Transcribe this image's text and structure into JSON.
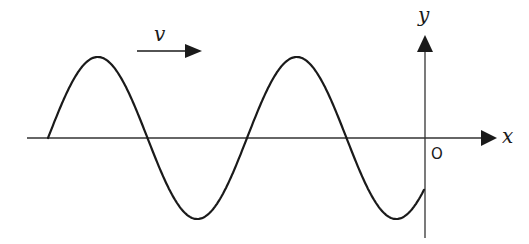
{
  "diagram": {
    "labels": {
      "velocity": "v",
      "x_axis": "x",
      "y_axis": "y",
      "origin": "O"
    },
    "colors": {
      "stroke": "#1a1a1a",
      "axis": "#333333",
      "background": "#ffffff"
    },
    "wave": {
      "type": "sinusoid",
      "direction": "+x",
      "amplitude_px": 81,
      "wavelength_px": 199,
      "start_x_px": 48,
      "end_x_px": 424,
      "baseline_y_px": 138
    }
  }
}
